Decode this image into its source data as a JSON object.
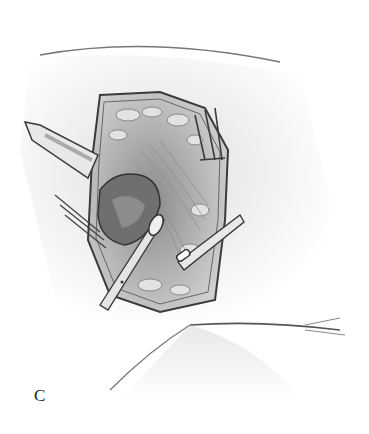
{
  "figure": {
    "panel_label": "C",
    "style": "grayscale pencil surgical illustration",
    "colors": {
      "background": "#ffffff",
      "skin_shade": "#d8d8d8",
      "tissue_mid": "#9a9a9a",
      "outline": "#3a3a3a",
      "cavity_dark": "#6a6a6a"
    }
  }
}
